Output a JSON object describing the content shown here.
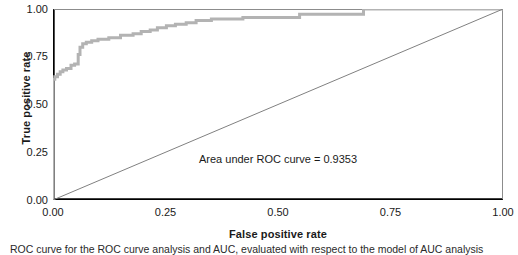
{
  "chart_data": {
    "type": "line",
    "title": "",
    "xlabel": "False positive rate",
    "ylabel": "True positive rate",
    "xlim": [
      0.0,
      1.0
    ],
    "ylim": [
      0.0,
      1.0
    ],
    "xticks": [
      "0.00",
      "0.25",
      "0.50",
      "0.75",
      "1.00"
    ],
    "xtick_values": [
      0.0,
      0.25,
      0.5,
      0.75,
      1.0
    ],
    "yticks": [
      "0.00",
      "0.25",
      "0.50",
      "0.75",
      "1.00"
    ],
    "ytick_values": [
      0.0,
      0.25,
      0.5,
      0.75,
      1.0
    ],
    "grid": false,
    "legend": "none",
    "annotations": [
      {
        "text": "Area under ROC curve = 0.9353",
        "x": 0.5,
        "y": 0.235
      }
    ],
    "series": [
      {
        "name": "ROC curve",
        "color": "#b3b3b3",
        "style": "step",
        "linewidth": 3,
        "x": [
          0.0,
          0.0,
          0.004,
          0.004,
          0.01,
          0.01,
          0.016,
          0.016,
          0.022,
          0.022,
          0.03,
          0.03,
          0.04,
          0.04,
          0.048,
          0.048,
          0.056,
          0.056,
          0.06,
          0.06,
          0.066,
          0.066,
          0.074,
          0.074,
          0.086,
          0.086,
          0.1,
          0.1,
          0.124,
          0.124,
          0.15,
          0.15,
          0.178,
          0.178,
          0.196,
          0.196,
          0.216,
          0.216,
          0.232,
          0.232,
          0.252,
          0.252,
          0.272,
          0.272,
          0.296,
          0.296,
          0.318,
          0.318,
          0.352,
          0.352,
          0.422,
          0.422,
          0.548,
          0.548,
          0.69,
          0.69,
          1.0
        ],
        "y": [
          0.0,
          0.632,
          0.632,
          0.645,
          0.645,
          0.658,
          0.658,
          0.672,
          0.672,
          0.68,
          0.68,
          0.688,
          0.688,
          0.705,
          0.705,
          0.712,
          0.712,
          0.762,
          0.762,
          0.8,
          0.8,
          0.818,
          0.818,
          0.826,
          0.826,
          0.834,
          0.834,
          0.842,
          0.842,
          0.85,
          0.85,
          0.862,
          0.862,
          0.87,
          0.87,
          0.882,
          0.882,
          0.89,
          0.89,
          0.902,
          0.902,
          0.912,
          0.912,
          0.92,
          0.92,
          0.928,
          0.928,
          0.94,
          0.94,
          0.948,
          0.948,
          0.955,
          0.955,
          0.972,
          0.972,
          1.0,
          1.0
        ]
      },
      {
        "name": "Chance diagonal",
        "color": "#808080",
        "style": "line",
        "linewidth": 1,
        "x": [
          0.0,
          1.0
        ],
        "y": [
          0.0,
          1.0
        ]
      }
    ],
    "auc": "0.9353"
  },
  "axes": {
    "frame_color": "#000000",
    "background": "#ffffff"
  },
  "caption": {
    "text": "ROC curve for the ROC curve analysis and AUC, evaluated with respect to the model of AUC analysis"
  }
}
